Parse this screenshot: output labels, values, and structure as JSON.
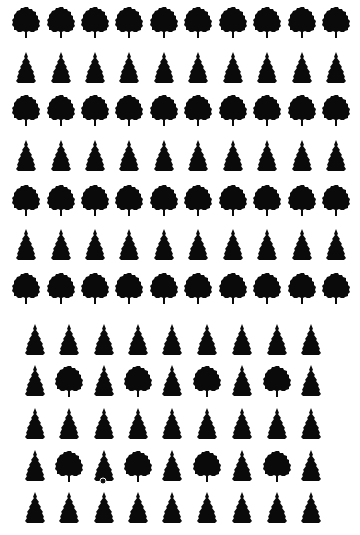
{
  "colors": {
    "tree": "#0a0a0a",
    "background": "#ffffff"
  },
  "icons": {
    "deciduous": "deciduous-tree-icon",
    "conifer": "conifer-tree-icon"
  },
  "top_grid": {
    "columns_x": [
      26,
      61,
      95,
      129,
      164,
      198,
      233,
      267,
      302,
      336
    ],
    "rows": [
      {
        "y": 22,
        "pattern": [
          "D",
          "D",
          "D",
          "D",
          "D",
          "D",
          "D",
          "D",
          "D",
          "D"
        ]
      },
      {
        "y": 68,
        "pattern": [
          "C",
          "C",
          "C",
          "C",
          "C",
          "C",
          "C",
          "C",
          "C",
          "C"
        ]
      },
      {
        "y": 110,
        "pattern": [
          "D",
          "D",
          "D",
          "D",
          "D",
          "D",
          "D",
          "D",
          "D",
          "D"
        ]
      },
      {
        "y": 156,
        "pattern": [
          "C",
          "C",
          "C",
          "C",
          "C",
          "C",
          "C",
          "C",
          "C",
          "C"
        ]
      },
      {
        "y": 200,
        "pattern": [
          "D",
          "D",
          "D",
          "D",
          "D",
          "D",
          "D",
          "D",
          "D",
          "D"
        ]
      },
      {
        "y": 245,
        "pattern": [
          "C",
          "C",
          "C",
          "C",
          "C",
          "C",
          "C",
          "C",
          "C",
          "C"
        ]
      },
      {
        "y": 288,
        "pattern": [
          "D",
          "D",
          "D",
          "D",
          "D",
          "D",
          "D",
          "D",
          "D",
          "D"
        ]
      }
    ]
  },
  "bottom_grid": {
    "columns_x": [
      35,
      69,
      104,
      138,
      172,
      207,
      242,
      277,
      311
    ],
    "rows": [
      {
        "y": 340,
        "pattern": [
          "C",
          "C",
          "C",
          "C",
          "C",
          "C",
          "C",
          "C",
          "C"
        ]
      },
      {
        "y": 381,
        "pattern": [
          "C",
          "D",
          "C",
          "D",
          "C",
          "D",
          "C",
          "D",
          "C"
        ]
      },
      {
        "y": 424,
        "pattern": [
          "C",
          "C",
          "C",
          "C",
          "C",
          "C",
          "C",
          "C",
          "C"
        ]
      },
      {
        "y": 466,
        "pattern": [
          "C",
          "D",
          "C",
          "D",
          "C",
          "D",
          "C",
          "D",
          "C"
        ]
      },
      {
        "y": 508,
        "pattern": [
          "C",
          "C",
          "C",
          "C",
          "C",
          "C",
          "C",
          "C",
          "C"
        ]
      }
    ]
  },
  "marker": {
    "x": 103,
    "y": 481,
    "label": "target-marker"
  }
}
